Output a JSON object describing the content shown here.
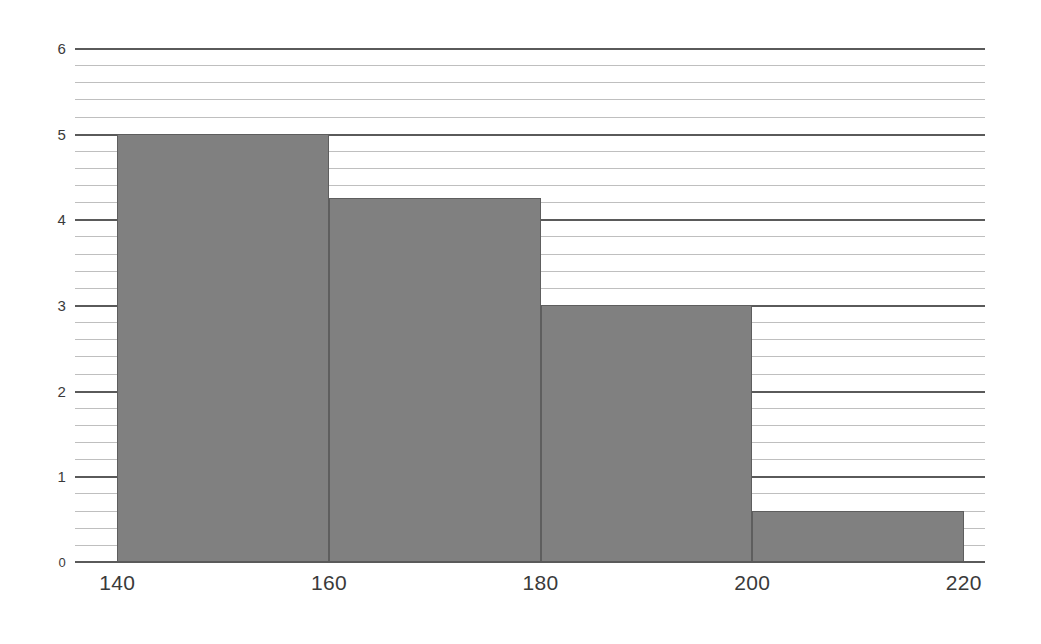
{
  "chart_data": {
    "type": "bar",
    "title": "",
    "subtitle": "",
    "xlabel": "",
    "ylabel": "",
    "categories": [
      "140",
      "160",
      "180",
      "200"
    ],
    "bin_edges": [
      140,
      160,
      180,
      200,
      220
    ],
    "values": [
      5,
      4.25,
      3,
      0.6
    ],
    "series": [
      {
        "name": "Frequency",
        "values": [
          5,
          4.25,
          3,
          0.6
        ]
      }
    ],
    "xlim": [
      136,
      222
    ],
    "ylim": [
      0,
      6
    ],
    "x_ticks": [
      "140",
      "160",
      "180",
      "200",
      "220"
    ],
    "x_tick_values": [
      140,
      160,
      180,
      200,
      220
    ],
    "y_ticks": [
      "0",
      "1",
      "2",
      "3",
      "4",
      "5",
      "6"
    ],
    "y_tick_values": [
      0,
      1,
      2,
      3,
      4,
      5,
      6
    ],
    "y_major_step": 1,
    "y_minor_step": 0.2,
    "grid": "horizontal-major-and-minor",
    "legend": "none",
    "annotations": [],
    "colors": {
      "bar_fill": "#808080",
      "bar_stroke": "#5e5e5e",
      "major_gridline": "#5a5a5a",
      "minor_gridline": "#bfbfbf",
      "axis_line": "#5a5a5a",
      "tick_label": "#3a3a3a",
      "background": "#ffffff"
    }
  }
}
